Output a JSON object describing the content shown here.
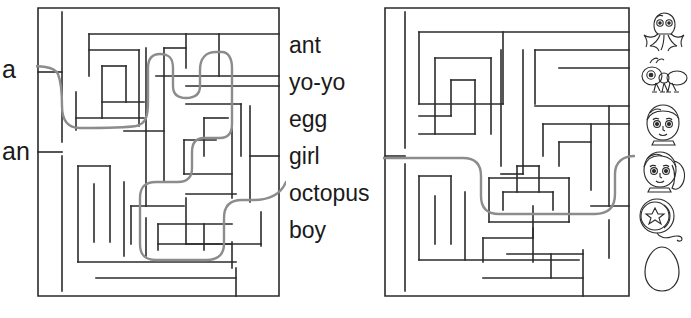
{
  "page": {
    "background_color": "#ffffff",
    "ink_color": "#2b2b2b",
    "solution_path_color": "#8c8c8c"
  },
  "left_panel": {
    "articles": [
      {
        "id": "a",
        "label": "a",
        "has_solution_line": true
      },
      {
        "id": "an",
        "label": "an",
        "has_solution_line": false
      }
    ]
  },
  "word_list": {
    "items": [
      {
        "word": "ant",
        "icon": "ant-icon"
      },
      {
        "word": "yo-yo",
        "icon": "yoyo-icon"
      },
      {
        "word": "egg",
        "icon": "egg-icon"
      },
      {
        "word": "girl",
        "icon": "girl-icon"
      },
      {
        "word": "octopus",
        "icon": "octopus-icon"
      },
      {
        "word": "boy",
        "icon": "boy-icon"
      }
    ]
  },
  "mazes": {
    "left": {
      "name": "article-maze",
      "entry_label": "a",
      "exit_label": "girl",
      "solved": true
    },
    "right": {
      "name": "picture-maze",
      "entry_label": "girl",
      "exit_label": "girl-icon",
      "solved": true
    }
  },
  "picture_column": {
    "icons": [
      {
        "name": "octopus-icon",
        "label": "octopus"
      },
      {
        "name": "ant-icon",
        "label": "ant"
      },
      {
        "name": "boy-icon",
        "label": "boy"
      },
      {
        "name": "girl-icon",
        "label": "girl"
      },
      {
        "name": "yoyo-icon",
        "label": "yo-yo"
      },
      {
        "name": "egg-icon",
        "label": "egg"
      }
    ]
  }
}
